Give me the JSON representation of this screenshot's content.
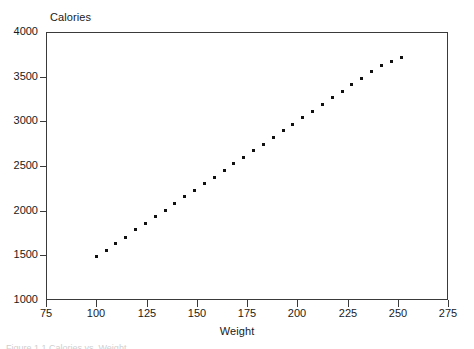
{
  "figure": {
    "caption_partial": "Figure 1.1  Calories vs. Weight"
  },
  "chart_data": {
    "type": "scatter",
    "title": "",
    "xlabel": "Weight",
    "ylabel": "Calories",
    "xlim": [
      75,
      275
    ],
    "ylim": [
      1000,
      4000
    ],
    "xticks": [
      75,
      100,
      125,
      150,
      175,
      200,
      225,
      250,
      275
    ],
    "yticks": [
      1000,
      1500,
      2000,
      2500,
      3000,
      3500,
      4000
    ],
    "xticklabels": [
      "75",
      "100",
      "125",
      "150",
      "175",
      "200",
      "225",
      "250",
      "275"
    ],
    "yticklabels": [
      "1000",
      "1500",
      "2000",
      "2500",
      "3000",
      "3500",
      "4000"
    ],
    "grid": false,
    "legend": null,
    "marker": "square",
    "marker_color": "#111111",
    "marker_size": 3,
    "frame_color": "#3a3a3a",
    "background": "#ffffff",
    "series": [
      {
        "name": "Calories",
        "points": [
          [
            100.0,
            1490
          ],
          [
            104.9,
            1560
          ],
          [
            109.8,
            1635
          ],
          [
            114.7,
            1705
          ],
          [
            119.6,
            1785
          ],
          [
            124.5,
            1855
          ],
          [
            129.4,
            1930
          ],
          [
            134.2,
            2005
          ],
          [
            139.1,
            2080
          ],
          [
            144.0,
            2155
          ],
          [
            148.9,
            2230
          ],
          [
            153.8,
            2300
          ],
          [
            158.7,
            2375
          ],
          [
            163.6,
            2450
          ],
          [
            168.5,
            2525
          ],
          [
            173.4,
            2600
          ],
          [
            178.3,
            2670
          ],
          [
            183.2,
            2745
          ],
          [
            188.1,
            2820
          ],
          [
            193.0,
            2895
          ],
          [
            197.8,
            2965
          ],
          [
            202.7,
            3040
          ],
          [
            207.6,
            3115
          ],
          [
            212.5,
            3190
          ],
          [
            217.4,
            3265
          ],
          [
            222.3,
            3335
          ],
          [
            227.2,
            3410
          ],
          [
            232.1,
            3485
          ],
          [
            237.0,
            3560
          ],
          [
            241.9,
            3630
          ],
          [
            246.8,
            3675
          ],
          [
            251.7,
            3720
          ]
        ]
      }
    ]
  }
}
